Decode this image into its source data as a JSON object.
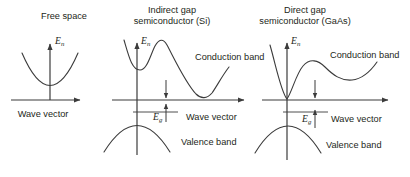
{
  "figure": {
    "background_color": "#ffffff",
    "stroke_color": "#3b3b3b",
    "text_color": "#231f20"
  },
  "panels": [
    {
      "id": "free-space",
      "title_line1": "Free space",
      "title_line2": "",
      "y_axis_label": "E",
      "y_axis_sub": "n",
      "x_axis_label": "Wave vector",
      "conduction_label": "",
      "valence_label": "",
      "gap_label": "",
      "gap_sub": ""
    },
    {
      "id": "indirect-gap-si",
      "title_line1": "Indirect gap",
      "title_line2": "semiconductor (Si)",
      "y_axis_label": "E",
      "y_axis_sub": "n",
      "x_axis_label": "Wave vector",
      "conduction_label": "Conduction band",
      "valence_label": "Valence band",
      "gap_label": "E",
      "gap_sub": "g"
    },
    {
      "id": "direct-gap-gaas",
      "title_line1": "Direct gap",
      "title_line2": "semiconductor (GaAs)",
      "y_axis_label": "E",
      "y_axis_sub": "n",
      "x_axis_label": "Wave vector",
      "conduction_label": "Conduction band",
      "valence_label": "Valence band",
      "gap_label": "E",
      "gap_sub": "g"
    }
  ]
}
